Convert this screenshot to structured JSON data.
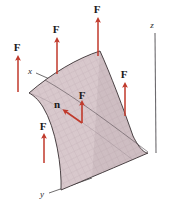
{
  "figure": {
    "surface": {
      "fill_color": "#d9c9cd",
      "mesh_color": "#a98f96",
      "edge_color": "#3a3234"
    },
    "arrow_color": "#c0392b",
    "axis_color": "#58565a",
    "axes": [
      {
        "name": "x-axis",
        "label": "x",
        "x": 30,
        "y": 72
      },
      {
        "name": "y-axis",
        "label": "y",
        "x": 42,
        "y": 196
      },
      {
        "name": "z-axis",
        "label": "z",
        "x": 152,
        "y": 26
      }
    ],
    "force_vectors": [
      {
        "name": "force-arrow-left-outer",
        "label": "F",
        "label_x": 17,
        "label_y": 51,
        "tail_x": 18,
        "tail_y": 92,
        "head_x": 18,
        "head_y": 56
      },
      {
        "name": "force-arrow-upper-left",
        "label": "F",
        "label_x": 56,
        "label_y": 32,
        "tail_x": 57,
        "tail_y": 74,
        "head_x": 57,
        "head_y": 38
      },
      {
        "name": "force-arrow-top",
        "label": "F",
        "label_x": 97,
        "label_y": 12,
        "tail_x": 98,
        "tail_y": 56,
        "head_x": 98,
        "head_y": 18
      },
      {
        "name": "force-arrow-right",
        "label": "F",
        "label_x": 124,
        "label_y": 77,
        "tail_x": 125,
        "tail_y": 116,
        "head_x": 125,
        "head_y": 83
      },
      {
        "name": "force-arrow-lower-left",
        "label": "F",
        "label_x": 43,
        "label_y": 130,
        "tail_x": 44,
        "tail_y": 163,
        "head_x": 44,
        "head_y": 134
      },
      {
        "name": "force-arrow-center",
        "label": "F",
        "label_x": 77,
        "label_y": 99,
        "tail_x": 82,
        "tail_y": 123,
        "head_x": 82,
        "head_y": 101
      }
    ],
    "normal_vector": {
      "name": "normal-vector-n",
      "label": "n",
      "label_x": 56,
      "label_y": 107,
      "tail_x": 82,
      "tail_y": 123,
      "head_x": 62,
      "head_y": 110
    }
  }
}
